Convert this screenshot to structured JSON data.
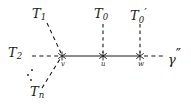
{
  "figure": {
    "type": "graph-diagram",
    "background_color": "#ffffff",
    "stroke_color": "#1a1a1a"
  },
  "labels": {
    "t1": {
      "base": "T",
      "sub": "1",
      "prime": ""
    },
    "t2": {
      "base": "T",
      "sub": "2",
      "prime": ""
    },
    "tn": {
      "base": "T",
      "sub": "n",
      "prime": ""
    },
    "t0": {
      "base": "T",
      "sub": "0",
      "prime": ""
    },
    "t0prime": {
      "base": "T",
      "sub": "0",
      "prime": "′"
    },
    "gamma": {
      "base": "γ",
      "prime": "″"
    }
  },
  "vertices": [
    {
      "id": "v",
      "label": "v",
      "x": 62,
      "y": 56
    },
    {
      "id": "u",
      "label": "u",
      "x": 103,
      "y": 56
    },
    {
      "id": "w",
      "label": "w",
      "x": 140,
      "y": 56
    }
  ],
  "edges": [
    {
      "from": "v",
      "to": "u",
      "style": "solid"
    },
    {
      "from": "u",
      "to": "w",
      "style": "solid"
    },
    {
      "from": "T2",
      "to": "v",
      "style": "dashed"
    },
    {
      "from": "T1",
      "to": "v",
      "style": "dashed"
    },
    {
      "from": "Tn",
      "to": "v",
      "style": "dashed"
    },
    {
      "from": "T0",
      "to": "u",
      "style": "dashed"
    },
    {
      "from": "T0prime",
      "to": "w",
      "style": "dashed"
    },
    {
      "from": "w",
      "to": "gamma",
      "style": "dashed"
    }
  ],
  "ellipsis": {
    "name": "diagonal-dots",
    "count": 3
  },
  "marks": {
    "vertex_glyph": "asterisk"
  }
}
